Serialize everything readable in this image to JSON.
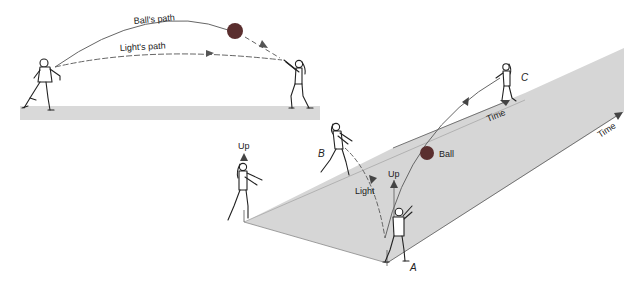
{
  "diagram": {
    "type": "spacetime-illustration",
    "colors": {
      "background": "#ffffff",
      "floor": "#d6d6d6",
      "floor_edge": "#9a9a9a",
      "ball": "#5a2e2e",
      "path_line": "#555555",
      "arrow": "#555555",
      "text": "#222222"
    },
    "top_scene": {
      "labels": {
        "ball_path": "Ball's path",
        "light_path": "Light's path"
      },
      "figures": [
        "thrower",
        "catcher"
      ]
    },
    "bottom_scene": {
      "labels": {
        "up_left": "Up",
        "up_center": "Up",
        "light": "Light",
        "ball": "Ball",
        "time_upper": "Time",
        "time_right": "Time",
        "point_a": "A",
        "point_b": "B",
        "point_c": "C"
      },
      "figures": [
        "observer-left",
        "observer-B",
        "observer-A",
        "observer-C"
      ]
    }
  }
}
